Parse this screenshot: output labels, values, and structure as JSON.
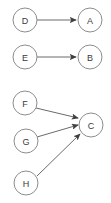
{
  "diagram": {
    "type": "directed-graph",
    "width": 111,
    "height": 203,
    "background_color": "#ffffff",
    "node_stroke_color": "#8d8d8d",
    "node_fill_color": "#ffffff",
    "node_label_color": "#3a3a3a",
    "edge_color": "#6b6b6b",
    "arrowhead_color": "#3f3f3f",
    "node_radius": 12,
    "nodes": [
      {
        "id": "D",
        "label": "D",
        "cx": 25,
        "cy": 20
      },
      {
        "id": "A",
        "label": "A",
        "cx": 90,
        "cy": 20
      },
      {
        "id": "E",
        "label": "E",
        "cx": 25,
        "cy": 57
      },
      {
        "id": "B",
        "label": "B",
        "cx": 90,
        "cy": 57
      },
      {
        "id": "F",
        "label": "F",
        "cx": 25,
        "cy": 103
      },
      {
        "id": "C",
        "label": "C",
        "cx": 91,
        "cy": 125
      },
      {
        "id": "G",
        "label": "G",
        "cx": 26,
        "cy": 141
      },
      {
        "id": "H",
        "label": "H",
        "cx": 26,
        "cy": 183
      }
    ],
    "edges": [
      {
        "id": "D-A",
        "from": "D",
        "to": "A",
        "label": "",
        "x1": 37,
        "y1": 20,
        "x2": 76,
        "y2": 20
      },
      {
        "id": "E-B",
        "from": "E",
        "to": "B",
        "label": "",
        "x1": 37,
        "y1": 57,
        "x2": 76,
        "y2": 57
      },
      {
        "id": "F-C",
        "from": "F",
        "to": "C",
        "label": "",
        "x1": 36,
        "y1": 108,
        "x2": 78,
        "y2": 118
      },
      {
        "id": "G-C",
        "from": "G",
        "to": "C",
        "label": "",
        "x1": 37,
        "y1": 137,
        "x2": 78,
        "y2": 125
      },
      {
        "id": "H-C",
        "from": "H",
        "to": "C",
        "label": "",
        "x1": 37,
        "y1": 176,
        "x2": 80,
        "y2": 134
      }
    ]
  }
}
